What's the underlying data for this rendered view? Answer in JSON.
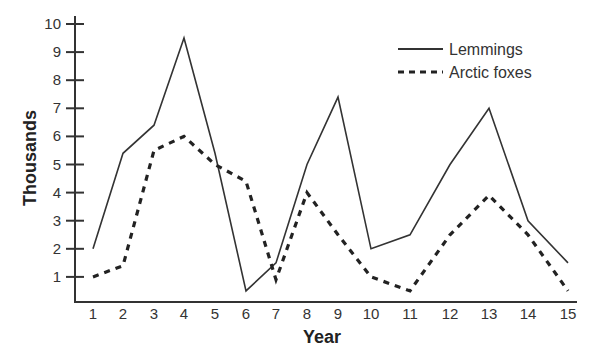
{
  "chart_data": {
    "type": "line",
    "title": "",
    "xlabel": "Year",
    "ylabel": "Thousands",
    "x": [
      1,
      2,
      3,
      4,
      5,
      6,
      7,
      8,
      9,
      10,
      11,
      12,
      13,
      14,
      15
    ],
    "x_tick_labels": [
      "1",
      "2",
      "3",
      "4",
      "5",
      "6",
      "7",
      "8",
      "9",
      "10",
      "11",
      "12",
      "13",
      "14",
      "15"
    ],
    "y_ticks": [
      1,
      2,
      3,
      4,
      5,
      6,
      7,
      8,
      9,
      10
    ],
    "y_tick_labels": [
      "1",
      "2",
      "3",
      "4",
      "5",
      "6",
      "7",
      "8",
      "9",
      "10"
    ],
    "ylim": [
      0,
      10
    ],
    "xlim": [
      1,
      15
    ],
    "grid": false,
    "legend_position": "top-right",
    "series": [
      {
        "name": "Lemmings",
        "style": "solid",
        "color": "#333333",
        "values": [
          2.0,
          5.4,
          6.4,
          9.5,
          5.4,
          0.5,
          1.5,
          5.0,
          7.4,
          2.0,
          2.5,
          5.0,
          7.0,
          3.0,
          1.5
        ]
      },
      {
        "name": "Arctic foxes",
        "style": "dashed",
        "color": "#222222",
        "values": [
          1.0,
          1.4,
          5.5,
          6.0,
          5.0,
          4.4,
          0.9,
          4.0,
          2.5,
          1.0,
          0.5,
          2.5,
          3.9,
          2.5,
          0.5
        ]
      }
    ]
  }
}
